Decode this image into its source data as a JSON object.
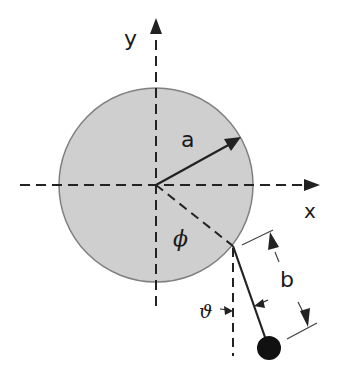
{
  "diagram": {
    "labels": {
      "x_axis": "x",
      "y_axis": "y",
      "disk_radius": "a",
      "pendulum_length": "b",
      "disk_angle": "ϕ",
      "pendulum_angle": "ϑ"
    },
    "colors": {
      "disk_fill": "#cfcfcf",
      "disk_stroke": "#808080",
      "line": "#222222",
      "bob": "#111111",
      "background": "#ffffff"
    },
    "geometry": {
      "disk_center": [
        156,
        185
      ],
      "disk_radius_px": 97,
      "pivot_point": [
        233,
        246
      ],
      "bob_center": [
        269,
        348
      ],
      "bob_radius_px": 12
    }
  }
}
